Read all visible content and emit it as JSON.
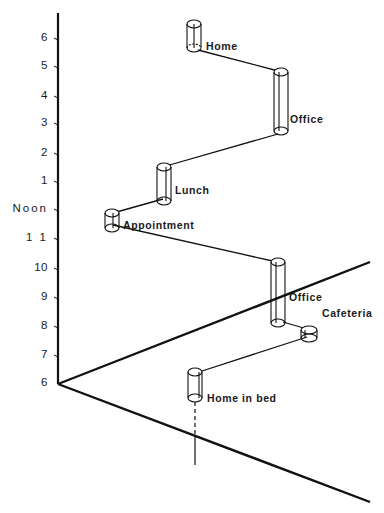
{
  "diagram": {
    "type": "space-time-path",
    "time_axis": {
      "ticks": [
        {
          "label": "6",
          "y": 38
        },
        {
          "label": "5",
          "y": 66
        },
        {
          "label": "4",
          "y": 96
        },
        {
          "label": "3",
          "y": 123
        },
        {
          "label": "2",
          "y": 153
        },
        {
          "label": "1",
          "y": 181
        },
        {
          "label": "Noon",
          "y": 209
        },
        {
          "label": "1 1",
          "y": 238
        },
        {
          "label": "10",
          "y": 268
        },
        {
          "label": "9",
          "y": 297
        },
        {
          "label": "8",
          "y": 326
        },
        {
          "label": "7",
          "y": 355
        },
        {
          "label": "6",
          "y": 384
        }
      ]
    },
    "places": [
      {
        "label": "Home in bed",
        "x": 207,
        "y": 392
      },
      {
        "label": "Cafeteria",
        "x": 322,
        "y": 307
      },
      {
        "label": "Office",
        "x": 289,
        "y": 291
      },
      {
        "label": "Appointment",
        "x": 123,
        "y": 219
      },
      {
        "label": "Lunch",
        "x": 175,
        "y": 184
      },
      {
        "label": "Office",
        "x": 290,
        "y": 113
      },
      {
        "label": "Home",
        "x": 206,
        "y": 40
      }
    ]
  },
  "colors": {
    "ink": "#111111",
    "background": "#ffffff"
  }
}
